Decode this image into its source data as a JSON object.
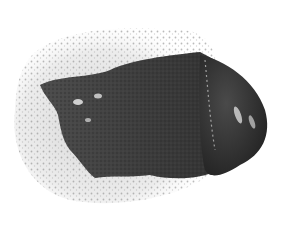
{
  "image": {
    "alt": "Swatch of dark grey cosmetic mask texture smeared on white background",
    "subject": "dark grey clay or charcoal mask smear",
    "background_color": "#ffffff",
    "colors": {
      "foam_halo": "#d9d9d9",
      "foam_dots": "#9a9a9a",
      "smear_dark": "#3a3a3a",
      "smear_mid": "#4a4a4a",
      "blob_dark": "#2e2e2e",
      "blob_highlight": "#bdbdbd"
    }
  }
}
